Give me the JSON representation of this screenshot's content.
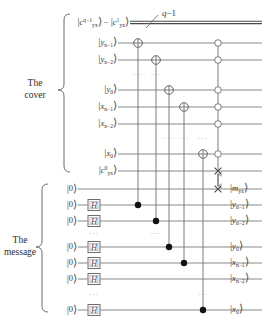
{
  "figure": {
    "bundle_label": "q−1",
    "sections": [
      {
        "name": "cover",
        "label_line1": "The",
        "label_line2": "cover"
      },
      {
        "name": "message",
        "label_line1": "The",
        "label_line2": "message"
      }
    ],
    "ellipsis": "···",
    "colors": {
      "wire": "#7a7a7a",
      "bundle_wire": "#4a4a4a",
      "gate_stroke": "#6d6d6d",
      "control_fill": "#111111",
      "open_control_fill": "#ffffff",
      "text": "#3a3a3a"
    }
  },
  "cover": {
    "inputs": [
      {
        "id": "c-bundle",
        "text": "|c",
        "sup": "q−1",
        "sub": "yx",
        "tail": "⟩ − |c",
        "sup2": "1",
        "sub2": "yx",
        "tail2": "⟩"
      },
      {
        "id": "y-n1",
        "base": "y",
        "sub": "n−1"
      },
      {
        "id": "y-n2",
        "base": "y",
        "sub": "n−2"
      },
      {
        "id": "y-0",
        "base": "y",
        "sub": "0"
      },
      {
        "id": "x-n1",
        "base": "x",
        "sub": "n−1"
      },
      {
        "id": "x-n2",
        "base": "x",
        "sub": "n−2"
      },
      {
        "id": "x-0",
        "base": "x",
        "sub": "0"
      },
      {
        "id": "c-0",
        "base": "c",
        "sub": "yx",
        "sup": "0"
      }
    ],
    "outputs": [
      {
        "id": "out-m",
        "base": "m",
        "sub": "yx"
      },
      {
        "id": "out-y-n1",
        "base": "y",
        "sub": "n−1"
      },
      {
        "id": "out-y-n2",
        "base": "y",
        "sub": "n−2"
      },
      {
        "id": "out-y-0",
        "base": "y",
        "sub": "0"
      },
      {
        "id": "out-x-n1",
        "base": "x",
        "sub": "n−1"
      },
      {
        "id": "out-x-n2",
        "base": "x",
        "sub": "n−2"
      },
      {
        "id": "out-x-0",
        "base": "x",
        "sub": "0"
      }
    ]
  },
  "message": {
    "input_label": "|0⟩",
    "hadamard_label": "H",
    "lines": [
      {
        "id": "msg-0",
        "has_hadamard": false
      },
      {
        "id": "msg-1",
        "has_hadamard": true
      },
      {
        "id": "msg-2",
        "has_hadamard": true
      },
      {
        "id": "msg-3",
        "has_hadamard": true
      },
      {
        "id": "msg-4",
        "has_hadamard": true
      },
      {
        "id": "msg-5",
        "has_hadamard": true
      },
      {
        "id": "msg-6",
        "has_hadamard": true
      }
    ]
  },
  "gates": {
    "targets": [
      {
        "id": "xor-y-n1",
        "col": 1
      },
      {
        "id": "xor-y-n2",
        "col": 2
      },
      {
        "id": "xor-y-0",
        "col": 3
      },
      {
        "id": "xor-x-n1",
        "col": 4
      },
      {
        "id": "xor-x-0",
        "col": 5
      }
    ],
    "open_controls": 7,
    "swap_marker": "×"
  }
}
